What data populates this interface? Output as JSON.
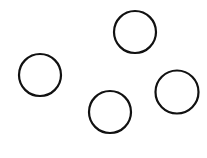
{
  "canvas": {
    "width": 207,
    "height": 158,
    "background": "#ffffff"
  },
  "shapes": [
    {
      "id": "circle-top",
      "type": "circle",
      "cx": 135,
      "cy": 32,
      "r": 21,
      "stroke": "#111111",
      "stroke_width": 2.2,
      "fill": "none"
    },
    {
      "id": "circle-left",
      "type": "circle",
      "cx": 40,
      "cy": 75,
      "r": 21,
      "stroke": "#111111",
      "stroke_width": 2.2,
      "fill": "none"
    },
    {
      "id": "circle-bottom",
      "type": "circle",
      "cx": 110,
      "cy": 112,
      "r": 21,
      "stroke": "#111111",
      "stroke_width": 2.2,
      "fill": "none"
    },
    {
      "id": "circle-right",
      "type": "circle",
      "cx": 177,
      "cy": 92,
      "r": 21.5,
      "stroke": "#111111",
      "stroke_width": 2.2,
      "fill": "none"
    }
  ]
}
